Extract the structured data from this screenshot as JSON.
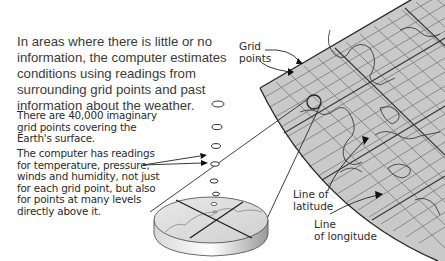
{
  "intro_text": "In areas where there is little or no information, the computer estimates conditions using readings from surrounding grid points and past information about the weather.",
  "notes": [
    "There are 40,000 imaginary grid points covering the Earth's surface.",
    "The computer has readings for temperature, pressure, winds and humidity, not just for each grid point, but also for points at many levels directly above it."
  ],
  "labels": {
    "grid_points_line1": "Grid",
    "grid_points_line2": "points",
    "latitude_line1": "Line of",
    "latitude_line2": "latitude",
    "longitude_line1": "Line",
    "longitude_line2": "of longitude"
  },
  "colors": {
    "grid_fill": "#c8c8c8",
    "grid_line": "#6e6e6e",
    "border": "#2e2e2e",
    "text": "#2b2b2b"
  }
}
